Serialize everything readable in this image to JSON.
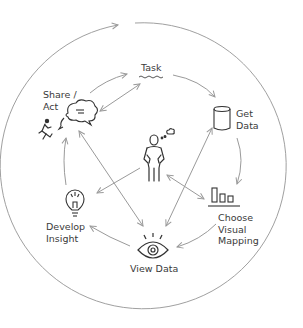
{
  "diagram": {
    "type": "cycle",
    "colors": {
      "line": "#9a9a9a",
      "icon": "#333333",
      "text": "#3a3a3a",
      "background": "#ffffff"
    },
    "nodes": [
      {
        "id": "task",
        "label": "Task",
        "icon": "wavy-underline-icon"
      },
      {
        "id": "get_data",
        "label_line1": "Get",
        "label_line2": "Data",
        "icon": "database-cylinder-icon"
      },
      {
        "id": "choose_visual_mapping",
        "label_line1": "Choose",
        "label_line2": "Visual",
        "label_line3": "Mapping",
        "icon": "bar-chart-icon"
      },
      {
        "id": "view_data",
        "label": "View Data",
        "icon": "eye-icon"
      },
      {
        "id": "develop_insight",
        "label_line1": "Develop",
        "label_line2": "Insight",
        "icon": "lightbulb-icon"
      },
      {
        "id": "share_act",
        "label_line1": "Share /",
        "label_line2": "Act",
        "icon": "speech-bubble-icon",
        "icon2": "running-person-icon"
      },
      {
        "id": "user",
        "label": "",
        "icon": "thinking-person-icon"
      }
    ],
    "edges": [
      {
        "from": "share_act",
        "to": "task",
        "direction": "forward"
      },
      {
        "from": "share_act",
        "to": "task",
        "direction": "both"
      },
      {
        "from": "task",
        "to": "get_data",
        "direction": "forward"
      },
      {
        "from": "get_data",
        "to": "choose_visual_mapping",
        "direction": "forward"
      },
      {
        "from": "choose_visual_mapping",
        "to": "view_data",
        "direction": "forward"
      },
      {
        "from": "view_data",
        "to": "develop_insight",
        "direction": "forward"
      },
      {
        "from": "develop_insight",
        "to": "share_act",
        "direction": "forward"
      },
      {
        "from": "share_act",
        "to": "view_data",
        "direction": "both"
      },
      {
        "from": "view_data",
        "to": "get_data",
        "direction": "both"
      },
      {
        "from": "user",
        "to": "develop_insight",
        "direction": "forward"
      },
      {
        "from": "user",
        "to": "choose_visual_mapping",
        "direction": "both"
      }
    ],
    "outer_cycle": {
      "direction": "clockwise"
    }
  }
}
